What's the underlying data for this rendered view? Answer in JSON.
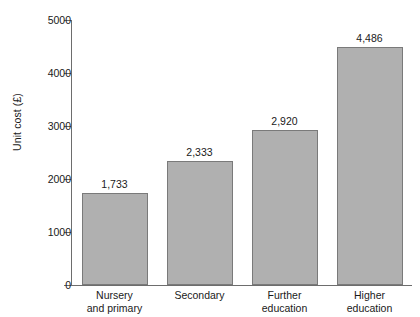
{
  "chart_data": {
    "type": "bar",
    "title": "",
    "xlabel": "",
    "ylabel": "Unit cost (£)",
    "categories": [
      "Nursery and primary",
      "Secondary",
      "Further education",
      "Higher education"
    ],
    "category_lines": [
      [
        "Nursery",
        "and primary"
      ],
      [
        "Secondary",
        ""
      ],
      [
        "Further",
        "education"
      ],
      [
        "Higher",
        "education"
      ]
    ],
    "values": [
      1733,
      2333,
      2920,
      4486
    ],
    "value_labels": [
      "1,733",
      "2,333",
      "2,920",
      "4,486"
    ],
    "ylim": [
      0,
      5000
    ],
    "yticks": [
      0,
      1000,
      2000,
      3000,
      4000,
      5000
    ],
    "ytick_labels": [
      "0",
      "1000",
      "2000",
      "3000",
      "4000",
      "5000"
    ],
    "grid": false,
    "legend": false,
    "bar_color": "#b0b0b0",
    "bar_border_color": "#7a7a7a",
    "axis_color": "#6d6d6d",
    "background_color": "#ffffff"
  }
}
